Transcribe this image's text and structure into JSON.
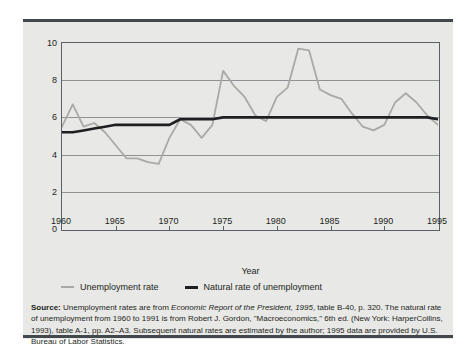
{
  "chart_data": {
    "type": "line",
    "title": "",
    "xlabel": "Year",
    "ylabel": "Unemployment rate (percent)",
    "xlim": [
      1960,
      1995
    ],
    "ylim": [
      0,
      10
    ],
    "xticks": [
      1960,
      1965,
      1970,
      1975,
      1980,
      1985,
      1990,
      1995
    ],
    "yticks": [
      0,
      2,
      4,
      6,
      8,
      10
    ],
    "grid": "horizontal",
    "legend_position": "below-axis",
    "x": [
      1960,
      1961,
      1962,
      1963,
      1964,
      1965,
      1966,
      1967,
      1968,
      1969,
      1970,
      1971,
      1972,
      1973,
      1974,
      1975,
      1976,
      1977,
      1978,
      1979,
      1980,
      1981,
      1982,
      1983,
      1984,
      1985,
      1986,
      1987,
      1988,
      1989,
      1990,
      1991,
      1992,
      1993,
      1994,
      1995
    ],
    "series": [
      {
        "name": "Unemployment rate",
        "color": "#a9a9a6",
        "values": [
          5.5,
          6.7,
          5.5,
          5.7,
          5.2,
          4.5,
          3.8,
          3.8,
          3.6,
          3.5,
          4.9,
          5.9,
          5.6,
          4.9,
          5.6,
          8.5,
          7.7,
          7.1,
          6.1,
          5.8,
          7.1,
          7.6,
          9.7,
          9.6,
          7.5,
          7.2,
          7.0,
          6.2,
          5.5,
          5.3,
          5.6,
          6.8,
          7.3,
          6.8,
          6.1,
          5.6
        ]
      },
      {
        "name": "Natural rate of unemployment",
        "color": "#1d1f21",
        "values": [
          5.2,
          5.2,
          5.3,
          5.4,
          5.5,
          5.6,
          5.6,
          5.6,
          5.6,
          5.6,
          5.6,
          5.9,
          5.9,
          5.9,
          5.9,
          6.0,
          6.0,
          6.0,
          6.0,
          6.0,
          6.0,
          6.0,
          6.0,
          6.0,
          6.0,
          6.0,
          6.0,
          6.0,
          6.0,
          6.0,
          6.0,
          6.0,
          6.0,
          6.0,
          6.0,
          5.9
        ]
      }
    ],
    "legend": [
      {
        "label": "Unemployment rate",
        "color": "#a9a9a6",
        "weight": "thin"
      },
      {
        "label": "Natural rate of unemployment",
        "color": "#1d1f21",
        "weight": "thick"
      }
    ]
  },
  "source_note": {
    "label": "Source:",
    "part1": " Unemployment rates are from ",
    "italic1": "Economic Report of the President, 1995",
    "part2": ", table B-40, p. 320. The natural rate of unemployment from 1960 to 1991 is from Robert J. Gordon, \"Macroeconomics,\" 6th ed. (New York: HarperCollins, 1993), table A-1, pp. A2–A3. Subsequent natural rates are estimated by the author; 1995 data are provided by U.S. Bureau of Labor Statistics."
  },
  "colors": {
    "figure_background": "#e8e8e6",
    "rule": "#43484c",
    "axis": "#5a5f63",
    "gridline": "#8e9295",
    "text": "#1d1f21"
  }
}
